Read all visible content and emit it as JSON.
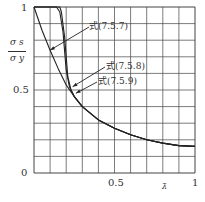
{
  "chart_data": {
    "type": "line",
    "title": "",
    "xlabel": "λ̄",
    "ylabel": "σs / σy",
    "ylabel_num": "σ s",
    "ylabel_den": "σ y",
    "xlim": [
      0,
      1
    ],
    "ylim": [
      0,
      1
    ],
    "grid": true,
    "grid_divisions": {
      "x": 10,
      "y": 10
    },
    "x_ticks": [
      {
        "value": 0.5,
        "label": "0.5"
      },
      {
        "value": 1,
        "label": "1"
      }
    ],
    "y_ticks": [
      {
        "value": 0,
        "label": "0"
      },
      {
        "value": 0.5,
        "label": "0.5"
      },
      {
        "value": 1,
        "label": "1"
      }
    ],
    "series": [
      {
        "name": "式(7.5.7)",
        "x": [
          0,
          0.05,
          0.1,
          0.15,
          0.2,
          0.25,
          0.3,
          0.4,
          0.5,
          0.6,
          0.7,
          0.8,
          0.9,
          1.0
        ],
        "y": [
          1.0,
          0.86,
          0.74,
          0.63,
          0.53,
          0.46,
          0.4,
          0.32,
          0.27,
          0.23,
          0.2,
          0.18,
          0.165,
          0.16
        ]
      },
      {
        "name": "式(7.5.8)",
        "x": [
          0,
          0.14,
          0.16,
          0.18,
          0.2,
          0.22,
          0.25,
          0.3,
          0.4,
          0.5,
          0.6,
          0.7,
          0.8,
          0.9,
          1.0
        ],
        "y": [
          1.0,
          1.0,
          0.97,
          0.85,
          0.62,
          0.52,
          0.46,
          0.4,
          0.32,
          0.27,
          0.23,
          0.2,
          0.18,
          0.165,
          0.16
        ]
      },
      {
        "name": "式(7.5.9)",
        "x": [
          0,
          0.16,
          0.17,
          0.19,
          0.21,
          0.23,
          0.25,
          0.3,
          0.4,
          0.5,
          0.6,
          0.7,
          0.8,
          0.9,
          1.0
        ],
        "y": [
          1.0,
          1.0,
          0.97,
          0.82,
          0.58,
          0.5,
          0.46,
          0.4,
          0.32,
          0.27,
          0.23,
          0.2,
          0.18,
          0.165,
          0.16
        ]
      }
    ],
    "annotations": [
      {
        "text": "式(7.5.7)",
        "points_to": [
          0.1,
          0.74
        ]
      },
      {
        "text": "式(7.5.8)",
        "points_to": [
          0.24,
          0.52
        ]
      },
      {
        "text": "式(7.5.9)",
        "points_to": [
          0.26,
          0.48
        ]
      }
    ]
  }
}
